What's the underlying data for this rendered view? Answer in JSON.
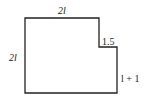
{
  "diagram": {
    "type": "l-shaped-figure",
    "labels": {
      "top": "2l",
      "left": "2l",
      "notch": "1.5",
      "right": "l + 1"
    },
    "stroke_color": "#222222"
  }
}
